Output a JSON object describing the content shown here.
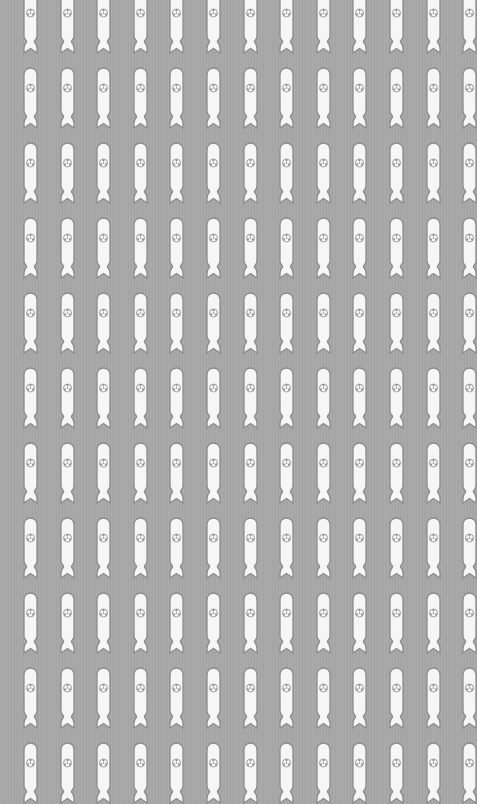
{
  "pattern": {
    "name": "nuclear-bomb-wallpaper",
    "motif": "bomb-with-radiation-symbol-icon",
    "colors": {
      "background": "#a7a7a7",
      "bomb_fill": "#f6f6f6",
      "bomb_outline": "#8c8c8c",
      "symbol": "#8a8a8a"
    },
    "grid": {
      "columns": 13,
      "rows": 11,
      "x_start": 23,
      "x_step": 36.6,
      "y_start": -8,
      "y_step": 75
    }
  }
}
